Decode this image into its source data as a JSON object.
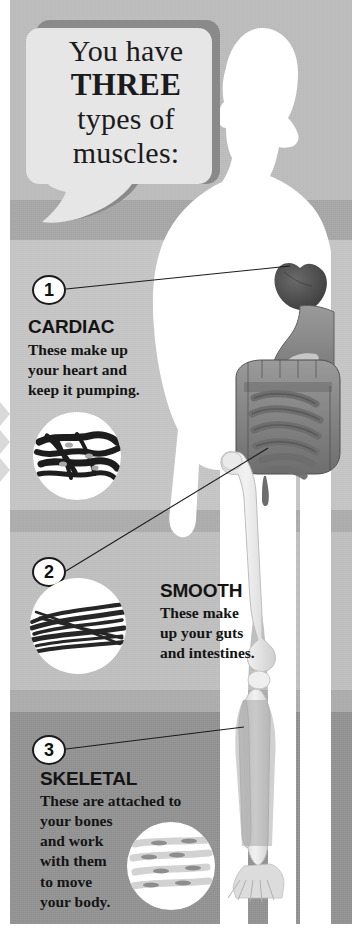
{
  "poster": {
    "title": "You have THREE types of muscles:",
    "headline": {
      "line1": "You have",
      "line2": "THREE",
      "line3": "types of",
      "line4": "muscles:"
    }
  },
  "colors": {
    "band_top": "#b9b9b9",
    "band_top_dark": "#a3a3a3",
    "band_cardiac": "#c2c2c2",
    "band_separator": "#a9a9a9",
    "band_smooth": "#bcbcbc",
    "band_skeletal": "#8e8e8e",
    "bubble_fill": "#e6e6e6",
    "bubble_shadow": "#8a8a8a",
    "text": "#141414",
    "silhouette": "#ffffff",
    "organ_dark": "#4a4a4a",
    "organ_mid": "#8c8c8c",
    "bone": "#e8e8e8"
  },
  "sections": [
    {
      "number": "1",
      "title": "CARDIAC",
      "body": "These make up your heart and keep it pumping.",
      "body_lines": [
        "These make up",
        "your heart and",
        "keep it pumping."
      ],
      "micrograph": "cardiac-muscle-micrograph",
      "points_to": "heart"
    },
    {
      "number": "2",
      "title": "SMOOTH",
      "body": "These make up your guts and intestines.",
      "body_lines": [
        "These make",
        "up your guts",
        "and intestines."
      ],
      "micrograph": "smooth-muscle-micrograph",
      "points_to": "intestines"
    },
    {
      "number": "3",
      "title": "SKELETAL",
      "body": "These are attached to your bones and work with them to move your body.",
      "body_lines": [
        "These are attached to",
        "your bones",
        "and work",
        "with them",
        "to move",
        "your body."
      ],
      "micrograph": "skeletal-muscle-micrograph",
      "points_to": "leg-bones"
    }
  ],
  "anatomy": {
    "figure": "human-body-silhouette",
    "organs": [
      "heart",
      "stomach",
      "large-intestine",
      "small-intestine"
    ],
    "bones": [
      "femur",
      "patella",
      "tibia",
      "fibula",
      "foot-bones"
    ]
  }
}
